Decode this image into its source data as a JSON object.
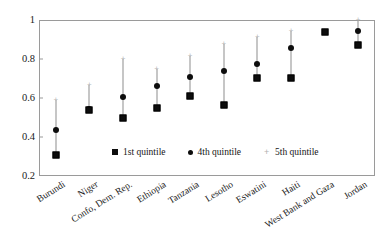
{
  "chart_data": {
    "type": "scatter",
    "title": "",
    "subtitle": "",
    "xlabel": "",
    "ylabel": "",
    "ylim": [
      0.2,
      1.0
    ],
    "yticks": [
      "0.2",
      "0.4",
      "0.6",
      "0.8",
      "1"
    ],
    "ytick_values": [
      0.2,
      0.4,
      0.6,
      0.8,
      1.0
    ],
    "grid": false,
    "legend_position": "inside-bottom-center",
    "categories": [
      "Burundi",
      "Niger",
      "Confo, Dem. Rep.",
      "Ethiopia",
      "Tanzania",
      "Lesotho",
      "Eswatini",
      "Haiti",
      "West Bank and Gaza",
      "Jordan"
    ],
    "series": [
      {
        "name": "1st quintile",
        "marker": "filled-square",
        "color": "#0d0d0d",
        "values": [
          0.31,
          0.54,
          0.5,
          0.55,
          0.61,
          0.565,
          0.705,
          0.705,
          0.94,
          0.87
        ]
      },
      {
        "name": "4th quintile",
        "marker": "filled-circle",
        "color": "#0d0d0d",
        "values": [
          0.435,
          0.545,
          0.605,
          0.66,
          0.71,
          0.74,
          0.775,
          0.855,
          0.94,
          0.945
        ]
      },
      {
        "name": "5th quintile",
        "marker": "plus",
        "color": "#b5b5b5",
        "values": [
          0.59,
          0.665,
          0.8,
          0.75,
          0.815,
          0.875,
          0.915,
          0.945,
          0.945,
          1.0
        ]
      }
    ]
  },
  "legend": {
    "items": [
      {
        "label": "1st quintile",
        "marker": "filled-square"
      },
      {
        "label": "4th quintile",
        "marker": "filled-circle"
      },
      {
        "label": "5th quintile",
        "marker": "plus"
      }
    ]
  }
}
